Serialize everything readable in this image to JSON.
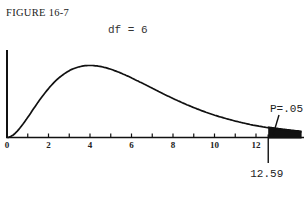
{
  "figure": {
    "label": "FIGURE 16-7",
    "df_label": "df = 6",
    "critical_value_label": "12.59",
    "p_label": "P=.05"
  },
  "chart_data": {
    "type": "line",
    "title": "FIGURE 16-7",
    "subtitle": "df = 6",
    "xlabel": "",
    "ylabel": "",
    "xlim": [
      0,
      14.2
    ],
    "x_ticks": [
      0,
      2,
      4,
      6,
      8,
      10,
      12
    ],
    "x_minor_ticks": [
      1,
      3,
      5,
      7,
      9,
      11
    ],
    "grid": false,
    "legend": null,
    "df": 6,
    "series": [
      {
        "name": "chi-square density (df=6)",
        "x": [
          0,
          1,
          2,
          3,
          4,
          5,
          6,
          7,
          8,
          9,
          10,
          11,
          12,
          12.59,
          14
        ],
        "y": [
          0,
          0.0379,
          0.092,
          0.1255,
          0.1353,
          0.1283,
          0.112,
          0.0925,
          0.0733,
          0.0562,
          0.0421,
          0.0309,
          0.0223,
          0.0185,
          0.0116
        ]
      }
    ],
    "annotations": [
      {
        "type": "vertical_line",
        "x": 12.59,
        "label": "12.59"
      },
      {
        "type": "shaded_region",
        "x_from": 12.59,
        "x_to": 14.2,
        "label": "P=.05"
      }
    ]
  }
}
